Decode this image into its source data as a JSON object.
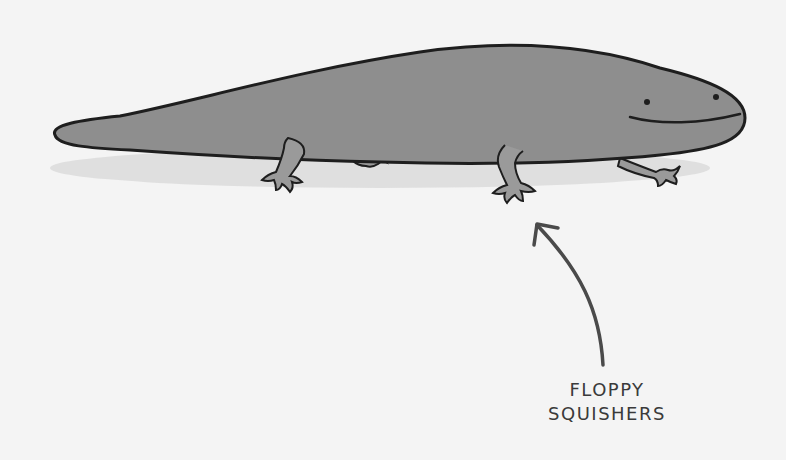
{
  "illustration": {
    "subject": "smiling salamander",
    "caption": {
      "line1": "FLOPPY",
      "line2": "SQUISHERS"
    },
    "colors": {
      "background": "#f4f4f4",
      "body_fill": "#8e8e8e",
      "outline": "#1e1e1e",
      "shadow": "#d6d6d6",
      "arrow": "#4a4a4a"
    }
  }
}
